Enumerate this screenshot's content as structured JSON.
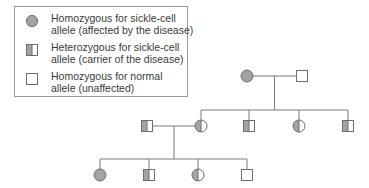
{
  "legend": {
    "items": [
      {
        "symbol": "filled-circle",
        "line1": "Homozygous for sickle-cell",
        "line2": "allele (affected by the disease)"
      },
      {
        "symbol": "half-filled-square",
        "line1": "Heterozygous for sickle-cell",
        "line2": "allele (carrier of the disease)"
      },
      {
        "symbol": "empty-square",
        "line1": "Homozygous for normal",
        "line2": "allele (unaffected)"
      }
    ]
  },
  "colors": {
    "fill": "#a3a3a3",
    "stroke": "#6e6e6e",
    "line": "#7a7a7a",
    "text": "#3a3a3a"
  },
  "pedigree": {
    "generation1": [
      {
        "sex": "female",
        "status": "affected",
        "x": 247,
        "y": 76
      },
      {
        "sex": "male",
        "status": "unaffected",
        "x": 302,
        "y": 76
      }
    ],
    "generation2": [
      {
        "sex": "male",
        "status": "carrier",
        "x": 147,
        "y": 126,
        "role": "spouse"
      },
      {
        "sex": "female",
        "status": "carrier",
        "x": 201,
        "y": 126
      },
      {
        "sex": "male",
        "status": "carrier",
        "x": 249,
        "y": 126
      },
      {
        "sex": "female",
        "status": "carrier",
        "x": 299,
        "y": 126
      },
      {
        "sex": "male",
        "status": "carrier",
        "x": 348,
        "y": 126
      }
    ],
    "generation3": [
      {
        "sex": "female",
        "status": "affected",
        "x": 100,
        "y": 175
      },
      {
        "sex": "male",
        "status": "carrier",
        "x": 149,
        "y": 175
      },
      {
        "sex": "female",
        "status": "carrier",
        "x": 198,
        "y": 175
      },
      {
        "sex": "male",
        "status": "unaffected",
        "x": 247,
        "y": 175
      }
    ]
  }
}
